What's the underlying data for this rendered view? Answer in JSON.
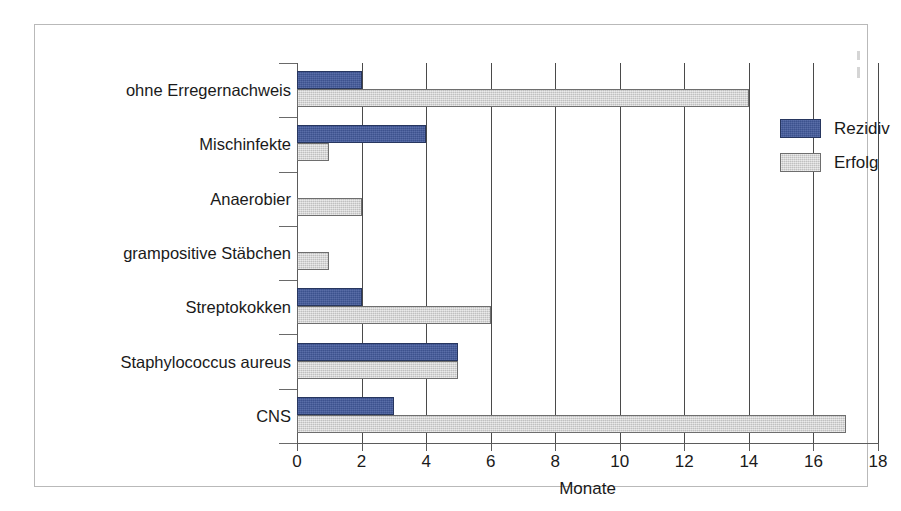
{
  "chart_data": {
    "type": "bar",
    "orientation": "horizontal",
    "title": "",
    "subtitle": "",
    "xlabel": "Monate",
    "ylabel": "",
    "xlim": [
      0,
      18
    ],
    "xticks": [
      0,
      2,
      4,
      6,
      8,
      10,
      12,
      14,
      16,
      18
    ],
    "xtick_labels": [
      "0",
      "2",
      "4",
      "6",
      "8",
      "10",
      "12",
      "14",
      "16",
      "18"
    ],
    "grid": "vertical",
    "legend_position": "right",
    "categories": [
      "ohne Erregernachweis",
      "Mischinfekte",
      "Anaerobier",
      "grampositive Stäbchen",
      "Streptokokken",
      "Staphylococcus aureus",
      "CNS"
    ],
    "series": [
      {
        "name": "Rezidiv",
        "color": "#42599B",
        "values": [
          2,
          4,
          0,
          0,
          2,
          5,
          3
        ]
      },
      {
        "name": "Erfolg",
        "color": "#D2D2D2",
        "values": [
          14,
          1,
          2,
          1,
          6,
          5,
          17
        ]
      }
    ],
    "annotations": []
  },
  "legend": {
    "entries": [
      {
        "label": "Rezidiv",
        "swatch": "rezidiv"
      },
      {
        "label": "Erfolg",
        "swatch": "erfolg"
      }
    ]
  }
}
